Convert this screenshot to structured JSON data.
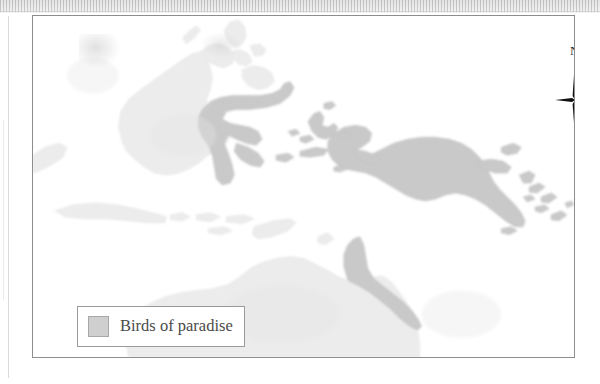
{
  "page": {
    "background_color": "#ffffff",
    "scan_artifact_strip": {
      "present": true,
      "color": "#dcdcdc"
    }
  },
  "map": {
    "frame": {
      "border_color": "#8d8d8d",
      "background_color": "#ffffff"
    },
    "region_description": "Indonesian archipelago, New Guinea and northern Australia",
    "colors": {
      "land_unshaded": "#ececec",
      "land_unshaded_outline": "#e0e0e0",
      "range_shaded": "#c9c9c9",
      "range_shaded_outline": "#bdbdbd",
      "ocean": "#ffffff"
    },
    "compass": {
      "north_label": "N",
      "style": "four-point-star",
      "color": "#111111"
    },
    "legend": {
      "entries": [
        {
          "swatch_color": "#cfcfcf",
          "swatch_border_color": "#a8a8a8",
          "label": "Birds of paradise"
        }
      ],
      "border_color": "#9a9a9a",
      "background_color": "#ffffff"
    },
    "landmasses_unshaded": [
      "Borneo",
      "Java",
      "Sumatra edge",
      "Lesser Sunda Islands",
      "Philippines",
      "Palawan",
      "Australia"
    ],
    "landmasses_shaded": [
      "Sulawesi",
      "Halmahera",
      "Maluku Islands",
      "Bird's Head Peninsula",
      "New Guinea",
      "New Britain",
      "New Ireland",
      "Solomon Islands",
      "Cape York Peninsula"
    ]
  }
}
